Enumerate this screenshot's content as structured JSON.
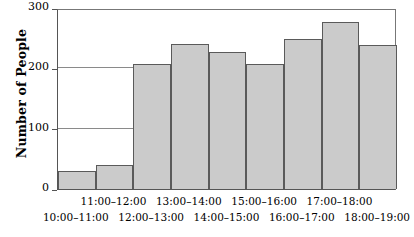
{
  "chart_data": {
    "type": "bar",
    "title": "",
    "xlabel": "",
    "ylabel": "Number of People",
    "categories": [
      "10:00–11:00",
      "11:00–12:00",
      "12:00–13:00",
      "13:00–14:00",
      "14:00–15:00",
      "15:00–16:00",
      "16:00–17:00",
      "17:00–18:00",
      "18:00–19:00"
    ],
    "values": [
      30,
      40,
      208,
      240,
      227,
      208,
      249,
      277,
      238
    ],
    "ylim": [
      0,
      300
    ],
    "yticks": [
      0,
      100,
      200,
      300
    ],
    "ytick_labels": [
      "0",
      "100",
      "200",
      "300"
    ],
    "gridlines": [
      100,
      200,
      300
    ],
    "grid": true,
    "legend": "none",
    "bar_fill_color": "#cbcbcb",
    "bar_edge_color": "#5a5a5a",
    "axis_color": "#555555",
    "gridline_color": "#8a8a8a",
    "label_stagger": [
      "bottom",
      "top",
      "bottom",
      "top",
      "bottom",
      "top",
      "bottom",
      "top",
      "bottom"
    ]
  }
}
